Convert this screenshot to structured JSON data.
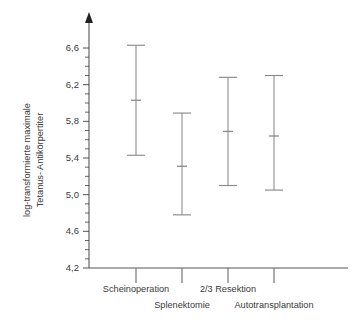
{
  "chart_data": {
    "type": "scatter",
    "title": "",
    "xlabel": "",
    "ylabel": "log-transformierte maximale Tetanus- Antikörpertiter",
    "ylabel_line1": "log-transformierte maximale",
    "ylabel_line2": "Tetanus- Antikörpertiter",
    "categories": [
      "Scheinoperation",
      "Splenektomie",
      "2/3 Resektion",
      "Autotransplantation"
    ],
    "ylim": [
      4.2,
      6.8
    ],
    "ytick_labels": [
      "4,2",
      "4,6",
      "5,0",
      "5,4",
      "5,8",
      "6,2",
      "6,6"
    ],
    "ytick_values": [
      4.2,
      4.6,
      5.0,
      5.4,
      5.8,
      6.2,
      6.6
    ],
    "minor_ticks_per_interval": 4,
    "grid": false,
    "legend": "none",
    "series": [
      {
        "name": "Mittelwert mit Konfidenzintervall",
        "means": [
          6.03,
          5.31,
          5.69,
          5.64
        ],
        "lower": [
          5.43,
          4.78,
          5.1,
          5.05
        ],
        "upper": [
          6.63,
          5.89,
          6.28,
          6.3
        ]
      }
    ],
    "points": [
      {
        "category": "Scheinoperation",
        "mean": 6.03,
        "lower": 5.43,
        "upper": 6.63
      },
      {
        "category": "Splenektomie",
        "mean": 5.31,
        "lower": 4.78,
        "upper": 5.89
      },
      {
        "category": "2/3 Resektion",
        "mean": 5.69,
        "lower": 5.1,
        "upper": 6.28
      },
      {
        "category": "Autotransplantation",
        "mean": 5.64,
        "lower": 5.05,
        "upper": 6.3
      }
    ],
    "colors": {
      "axis": "#555555",
      "errorbar": "#8a8a8a",
      "text": "#3a3a3a",
      "background": "#ffffff"
    }
  }
}
